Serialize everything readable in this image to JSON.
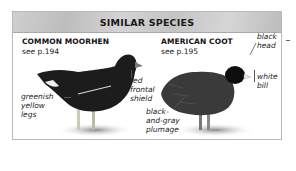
{
  "panel": {
    "title": "SIMILAR SPECIES"
  },
  "species": [
    {
      "name": "COMMON MOORHEN",
      "page_ref": "see p.194",
      "labels": [
        {
          "text": "red\nfrontal\nshield"
        },
        {
          "text": "greenish\nyellow\nlegs"
        }
      ]
    },
    {
      "name": "AMERICAN COOT",
      "page_ref": "see p.195",
      "labels": [
        {
          "text": "black\nhead"
        },
        {
          "text": "white\nbill"
        },
        {
          "text": "black-\nand-gray\nplumage"
        }
      ]
    }
  ],
  "colors": {
    "header_bg": "#c8c8c8",
    "border": "#b9b9b9",
    "bird_dark": "#1c1c1c",
    "bird_coot_body": "#3a3a3a"
  }
}
